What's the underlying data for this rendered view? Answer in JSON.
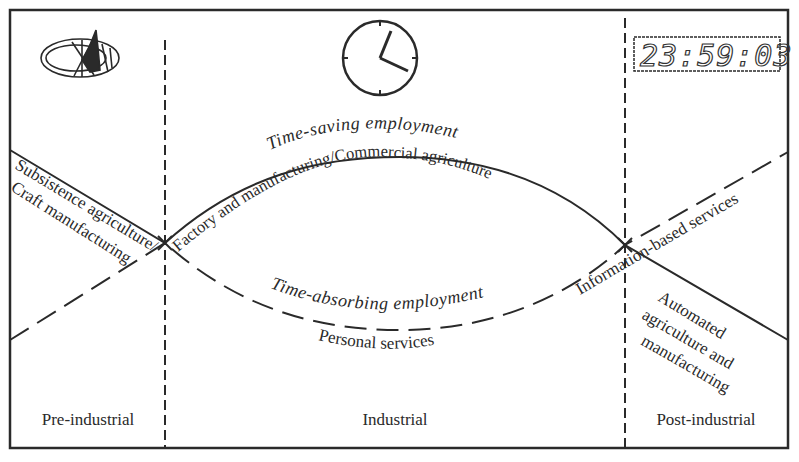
{
  "diagram": {
    "eras": [
      {
        "label": "Pre-industrial"
      },
      {
        "label": "Industrial"
      },
      {
        "label": "Post-industrial"
      }
    ],
    "icons": {
      "pre_industrial": "sundial-icon",
      "industrial": "analog-clock-icon",
      "post_industrial": "digital-clock-icon"
    },
    "digital_clock": {
      "time": "23:59:03"
    },
    "curves": {
      "time_saving": {
        "title": "Time-saving employment",
        "style": "solid",
        "segments": [
          "Subsistence agriculture/",
          "Factory and manufacturing/Commercial agriculture",
          "Automated agriculture and manufacturing"
        ]
      },
      "time_absorbing": {
        "title": "Time-absorbing employment",
        "style": "dashed",
        "segments": [
          "Craft manufacturing",
          "Personal services",
          "Information-based services"
        ]
      }
    },
    "labels": {
      "subsistence": "Subsistence agriculture/",
      "craft": "Craft manufacturing",
      "factory": "Factory and manufacturing/Commercial agriculture",
      "time_saving": "Time-saving employment",
      "time_absorbing": "Time-absorbing employment",
      "personal": "Personal services",
      "information": "Information-based services",
      "automated_1": "Automated",
      "automated_2": "agriculture and",
      "automated_3": "manufacturing"
    }
  }
}
